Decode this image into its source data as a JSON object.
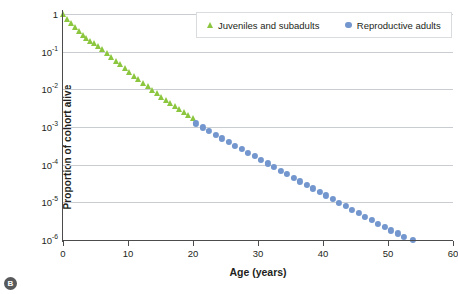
{
  "badge": {
    "label": "B"
  },
  "legend": {
    "position": "top-center",
    "entries": [
      {
        "label": "Juveniles and subadults",
        "marker": "triangle-marker",
        "color": "#8cc63f"
      },
      {
        "label": "Reproductive adults",
        "marker": "circle-marker",
        "color": "#7296cd"
      }
    ]
  },
  "axes": {
    "xlabel": "Age (years)",
    "ylabel": "Proportion of cohort alive",
    "xticks": [
      "0",
      "10",
      "20",
      "30",
      "40",
      "50",
      "60"
    ],
    "yticks": [
      "1",
      "10⁻¹",
      "10⁻²",
      "10⁻³",
      "10⁻⁴",
      "10⁻⁵",
      "10⁻⁶"
    ],
    "ytick_mantissa": [
      "1",
      "10",
      "10",
      "10",
      "10",
      "10",
      "10"
    ],
    "ytick_exponent": [
      "",
      "-1",
      "-2",
      "-3",
      "-4",
      "-5",
      "-6"
    ]
  },
  "chart_data": {
    "type": "scatter",
    "title": "",
    "xlabel": "Age (years)",
    "ylabel": "Proportion of cohort alive",
    "xlim": [
      0,
      60
    ],
    "ylim": [
      1e-06,
      1
    ],
    "yscale": "log",
    "xticks": [
      0,
      10,
      20,
      30,
      40,
      50,
      60
    ],
    "yticks": [
      1,
      0.1,
      0.01,
      0.001,
      0.0001,
      1e-05,
      1e-06
    ],
    "grid": "horizontal",
    "legend_position": "top-center",
    "series": [
      {
        "name": "Juveniles and subadults",
        "marker": "triangle",
        "color": "#8cc63f",
        "points": [
          [
            0.0,
            1.0
          ],
          [
            0.6,
            0.72
          ],
          [
            1.2,
            0.56
          ],
          [
            1.8,
            0.44
          ],
          [
            2.4,
            0.35
          ],
          [
            3.0,
            0.285
          ],
          [
            3.6,
            0.235
          ],
          [
            4.2,
            0.196
          ],
          [
            4.8,
            0.165
          ],
          [
            5.4,
            0.14
          ],
          [
            6.0,
            0.12
          ],
          [
            6.7,
            0.094
          ],
          [
            7.4,
            0.074
          ],
          [
            8.1,
            0.058
          ],
          [
            8.8,
            0.046
          ],
          [
            9.5,
            0.037
          ],
          [
            10.2,
            0.029
          ],
          [
            10.9,
            0.023
          ],
          [
            11.6,
            0.0185
          ],
          [
            12.3,
            0.0148
          ],
          [
            13.0,
            0.0119
          ],
          [
            13.7,
            0.0096
          ],
          [
            14.4,
            0.0078
          ],
          [
            15.1,
            0.0064
          ],
          [
            15.8,
            0.0053
          ],
          [
            16.5,
            0.0044
          ],
          [
            17.2,
            0.0036
          ],
          [
            17.9,
            0.003
          ],
          [
            18.6,
            0.0025
          ],
          [
            19.3,
            0.0021
          ],
          [
            20.0,
            0.00175
          ]
        ]
      },
      {
        "name": "Reproductive adults",
        "marker": "circle",
        "color": "#7296cd",
        "points": [
          [
            20.5,
            0.00125
          ],
          [
            21.5,
            0.00098
          ],
          [
            22.5,
            0.00078
          ],
          [
            23.5,
            0.00062
          ],
          [
            24.5,
            0.0005
          ],
          [
            25.5,
            0.0004
          ],
          [
            26.5,
            0.00032
          ],
          [
            27.5,
            0.00026
          ],
          [
            28.5,
            0.00021
          ],
          [
            29.5,
            0.00017
          ],
          [
            30.5,
            0.000135
          ],
          [
            31.5,
            0.000108
          ],
          [
            32.5,
            8.7e-05
          ],
          [
            33.5,
            7e-05
          ],
          [
            34.5,
            5.6e-05
          ],
          [
            35.5,
            4.5e-05
          ],
          [
            36.5,
            3.6e-05
          ],
          [
            37.5,
            2.9e-05
          ],
          [
            38.5,
            2.35e-05
          ],
          [
            39.5,
            1.89e-05
          ],
          [
            40.5,
            1.52e-05
          ],
          [
            41.5,
            1.22e-05
          ],
          [
            42.5,
            9.9e-06
          ],
          [
            43.5,
            8e-06
          ],
          [
            44.5,
            6.4e-06
          ],
          [
            45.5,
            5.2e-06
          ],
          [
            46.5,
            4.2e-06
          ],
          [
            47.5,
            3.4e-06
          ],
          [
            48.5,
            2.7e-06
          ],
          [
            49.5,
            2.2e-06
          ],
          [
            50.5,
            1.8e-06
          ],
          [
            51.5,
            1.5e-06
          ],
          [
            52.5,
            1.2e-06
          ],
          [
            53.8,
            1e-06
          ]
        ]
      }
    ]
  }
}
